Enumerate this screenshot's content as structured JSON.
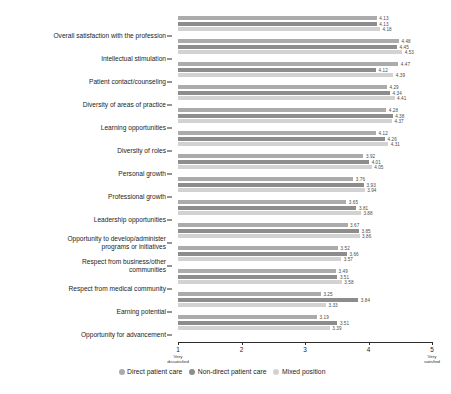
{
  "chart_data": {
    "type": "bar",
    "orientation": "horizontal",
    "grouped": true,
    "title": "",
    "subtitle": "",
    "xlabel": "",
    "ylabel": "",
    "xlim": [
      1,
      5
    ],
    "grid": false,
    "legend_position": "bottom",
    "xticks": [
      {
        "value": 1,
        "label": "1",
        "sublabel": "Very\ndissatisfied"
      },
      {
        "value": 2,
        "label": "2",
        "sublabel": ""
      },
      {
        "value": 3,
        "label": "3",
        "sublabel": ""
      },
      {
        "value": 4,
        "label": "4",
        "sublabel": ""
      },
      {
        "value": 5,
        "label": "5",
        "sublabel": "Very\nsatisfied"
      }
    ],
    "categories": [
      "Overall satisfaction with the profession",
      "Intellectual stimulation",
      "Patient contact/counseling",
      "Diversity of areas of practice",
      "Learning opportunities",
      "Diversity of roles",
      "Personal growth",
      "Professional growth",
      "Leadership opportunities",
      "Opportunity to develop/administer\nprograms or initiatives",
      "Respect from business/other\ncommunities",
      "Respect from medical community",
      "Earning potential",
      "Opportunity for advancement"
    ],
    "series": [
      {
        "name": "Direct patient care",
        "color": "#ababab",
        "values": [
          4.13,
          4.48,
          4.47,
          4.29,
          4.28,
          4.12,
          3.92,
          3.76,
          3.65,
          3.67,
          3.52,
          3.49,
          3.25,
          3.19
        ]
      },
      {
        "name": "Non-direct patient care",
        "color": "#8d8d8d",
        "values": [
          4.13,
          4.45,
          4.12,
          4.34,
          4.38,
          4.26,
          4.01,
          3.93,
          3.81,
          3.85,
          3.66,
          3.51,
          3.84,
          3.51
        ]
      },
      {
        "name": "Mixed position",
        "color": "#d2d2d2",
        "values": [
          4.18,
          4.53,
          4.39,
          4.41,
          4.37,
          4.31,
          4.05,
          3.94,
          3.88,
          3.86,
          3.57,
          3.58,
          3.33,
          3.39
        ]
      }
    ]
  }
}
